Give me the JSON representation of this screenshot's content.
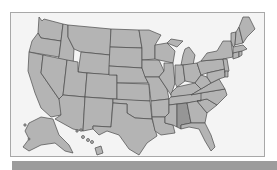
{
  "map": {
    "title": "United States",
    "highlighted_state": "Alabama",
    "colors": {
      "state_fill": "#b4b4b4",
      "highlight_fill": "#969696",
      "border": "#4a4a4a",
      "background": "#f4f4f4",
      "frame": "#a8a8a8",
      "bottom_bar": "#9c9c9c"
    }
  }
}
